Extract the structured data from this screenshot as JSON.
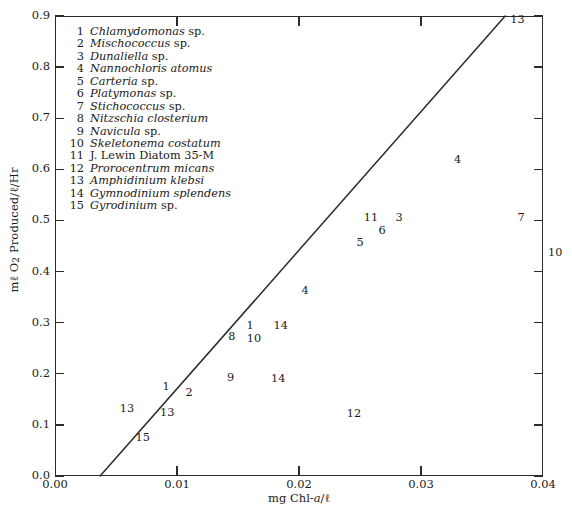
{
  "chart_data": {
    "type": "scatter",
    "title": "",
    "subtitle": "",
    "xlabel": "mg Chl-a/ℓ",
    "ylabel": "mℓ O₂ Produced/ℓ/Hr",
    "xlim": [
      0.0,
      0.04
    ],
    "ylim": [
      0.0,
      0.9
    ],
    "xticks": [
      "0.00",
      "0.01",
      "0.02",
      "0.03",
      "0.04"
    ],
    "xtick_values": [
      0.0,
      0.01,
      0.02,
      0.03,
      0.04
    ],
    "yticks": [
      "0.0",
      "0.1",
      "0.2",
      "0.3",
      "0.4",
      "0.5",
      "0.6",
      "0.7",
      "0.8",
      "0.9"
    ],
    "ytick_values": [
      0.0,
      0.1,
      0.2,
      0.3,
      0.4,
      0.5,
      0.6,
      0.7,
      0.8,
      0.9
    ],
    "grid": false,
    "legend_position": "upper-left-inside",
    "point_marker": "numeric-label",
    "trendline": {
      "type": "line",
      "x_start": 0.0037,
      "y_start": 0.0,
      "x_end": 0.0369,
      "y_end": 0.9
    },
    "legend": [
      {
        "num": "1",
        "name": "Chlamydomonas sp.",
        "italic": "Chlamydomonas",
        "suffix": " sp."
      },
      {
        "num": "2",
        "name": "Mischococcus sp.",
        "italic": "Mischococcus",
        "suffix": " sp."
      },
      {
        "num": "3",
        "name": "Dunaliella sp.",
        "italic": "Dunaliella",
        "suffix": " sp."
      },
      {
        "num": "4",
        "name": "Nannochloris atomus",
        "italic": "Nannochloris atomus",
        "suffix": ""
      },
      {
        "num": "5",
        "name": "Carteria sp.",
        "italic": "Carteria",
        "suffix": " sp."
      },
      {
        "num": "6",
        "name": "Platymonas sp.",
        "italic": "Platymonas",
        "suffix": " sp."
      },
      {
        "num": "7",
        "name": "Stichococcus sp.",
        "italic": "Stichococcus",
        "suffix": " sp."
      },
      {
        "num": "8",
        "name": "Nitzschia closterium",
        "italic": "Nitzschia closterium",
        "suffix": ""
      },
      {
        "num": "9",
        "name": "Navicula sp.",
        "italic": "Navicula",
        "suffix": " sp."
      },
      {
        "num": "10",
        "name": "Skeletonema costatum",
        "italic": "Skeletonema costatum",
        "suffix": ""
      },
      {
        "num": "11",
        "name": "J. Lewin Diatom 35-M",
        "italic": "",
        "suffix": "J. Lewin Diatom 35-M"
      },
      {
        "num": "12",
        "name": "Prorocentrum micans",
        "italic": "Prorocentrum micans",
        "suffix": ""
      },
      {
        "num": "13",
        "name": "Amphidinium klebsi",
        "italic": "Amphidinium klebsi",
        "suffix": ""
      },
      {
        "num": "14",
        "name": "Gymnodinium splendens",
        "italic": "Gymnodinium splendens",
        "suffix": ""
      },
      {
        "num": "15",
        "name": "Gyrodinium sp.",
        "italic": "Gyrodinium",
        "suffix": " sp."
      }
    ],
    "points": [
      {
        "label": "15",
        "x": 0.0072,
        "y": 0.075
      },
      {
        "label": "13",
        "x": 0.0059,
        "y": 0.132
      },
      {
        "label": "13",
        "x": 0.0092,
        "y": 0.123
      },
      {
        "label": "1",
        "x": 0.0091,
        "y": 0.175
      },
      {
        "label": "2",
        "x": 0.011,
        "y": 0.163
      },
      {
        "label": "9",
        "x": 0.0144,
        "y": 0.192
      },
      {
        "label": "14",
        "x": 0.0183,
        "y": 0.19
      },
      {
        "label": "8",
        "x": 0.0145,
        "y": 0.272
      },
      {
        "label": "10",
        "x": 0.0163,
        "y": 0.268
      },
      {
        "label": "1",
        "x": 0.016,
        "y": 0.293
      },
      {
        "label": "14",
        "x": 0.0185,
        "y": 0.293
      },
      {
        "label": "4",
        "x": 0.0205,
        "y": 0.363
      },
      {
        "label": "12",
        "x": 0.0245,
        "y": 0.121
      },
      {
        "label": "5",
        "x": 0.025,
        "y": 0.455
      },
      {
        "label": "6",
        "x": 0.0268,
        "y": 0.48
      },
      {
        "label": "11",
        "x": 0.0259,
        "y": 0.505
      },
      {
        "label": "3",
        "x": 0.0282,
        "y": 0.505
      },
      {
        "label": "4",
        "x": 0.033,
        "y": 0.618
      },
      {
        "label": "7",
        "x": 0.0382,
        "y": 0.505
      },
      {
        "label": "13",
        "x": 0.0379,
        "y": 0.893
      },
      {
        "label": "10",
        "x": 0.041,
        "y": 0.437
      }
    ]
  },
  "style": {
    "axis_color": "#2b2b2b",
    "text_color": "#1a1a1a",
    "line_color": "#2b2b2b",
    "background": "#ffffff"
  }
}
